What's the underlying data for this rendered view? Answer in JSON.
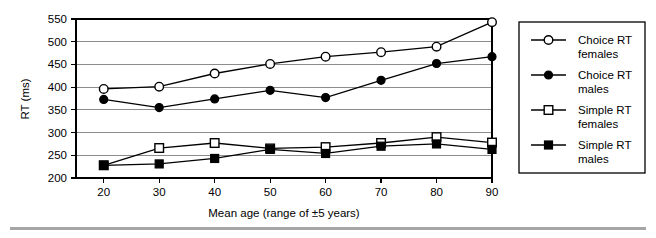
{
  "figure": {
    "background_color": "#ffffff",
    "footer_rule_color": "#a6a6a6"
  },
  "chart_data": {
    "type": "line",
    "title": "",
    "xlabel": "Mean age (range of ±5 years)",
    "ylabel": "RT (ms)",
    "x": [
      20,
      30,
      40,
      50,
      60,
      70,
      80,
      90
    ],
    "xtick_labels": [
      "20",
      "30",
      "40",
      "50",
      "60",
      "70",
      "80",
      "90"
    ],
    "xlim": [
      15,
      90
    ],
    "ylim": [
      200,
      550
    ],
    "ytick_labels": [
      "200",
      "250",
      "300",
      "350",
      "400",
      "450",
      "500",
      "550"
    ],
    "yticks": [
      200,
      250,
      300,
      350,
      400,
      450,
      500,
      550
    ],
    "grid": "horizontal",
    "legend_position": "right-outside",
    "series": [
      {
        "name": "Choice RT females",
        "marker": "open-circle",
        "values": [
          396,
          401,
          430,
          451,
          467,
          477,
          489,
          543
        ]
      },
      {
        "name": "Choice RT males",
        "marker": "filled-circle",
        "values": [
          373,
          355,
          374,
          393,
          377,
          415,
          452,
          467
        ]
      },
      {
        "name": "Simple RT females",
        "marker": "open-square",
        "values": [
          228,
          266,
          277,
          265,
          268,
          277,
          290,
          278
        ]
      },
      {
        "name": "Simple RT males",
        "marker": "filled-square",
        "values": [
          228,
          231,
          243,
          263,
          254,
          270,
          275,
          263
        ]
      }
    ]
  },
  "legend": {
    "entries": [
      {
        "line1": "Choice RT",
        "line2": "females",
        "marker": "open-circle"
      },
      {
        "line1": "Choice RT",
        "line2": "males",
        "marker": "filled-circle"
      },
      {
        "line1": "Simple RT",
        "line2": "females",
        "marker": "open-square"
      },
      {
        "line1": "Simple RT",
        "line2": "males",
        "marker": "filled-square"
      }
    ]
  }
}
